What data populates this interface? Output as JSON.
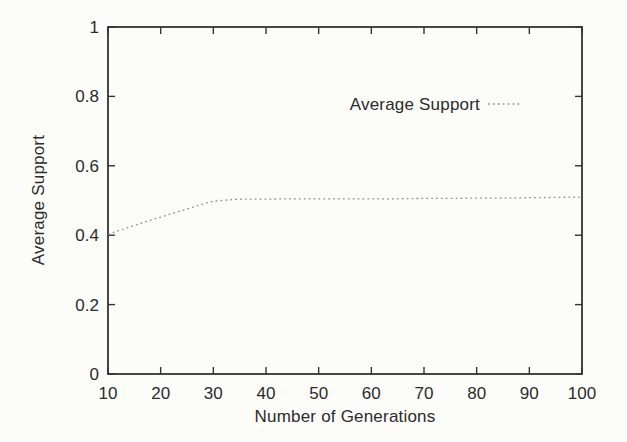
{
  "figure": {
    "background": "#fcfcf9"
  },
  "colors": {
    "axis": "#333333",
    "text": "#2b2b2b",
    "curve": "#8f8f8f"
  },
  "chart_data": {
    "type": "line",
    "title": "",
    "xlabel": "Number of Generations",
    "ylabel": "Average Support",
    "xlim": [
      10,
      100
    ],
    "ylim": [
      0,
      1
    ],
    "grid": false,
    "xticks": [
      10,
      20,
      30,
      40,
      50,
      60,
      70,
      80,
      90,
      100
    ],
    "xtick_labels": [
      "10",
      "20",
      "30",
      "40",
      "50",
      "60",
      "70",
      "80",
      "90",
      "100"
    ],
    "yticks": [
      0,
      0.2,
      0.4,
      0.6,
      0.8,
      1
    ],
    "ytick_labels": [
      "0",
      "0.2",
      "0.4",
      "0.6",
      "0.8",
      "1"
    ],
    "legend": {
      "position": "inside-upper-right",
      "entries": [
        {
          "label": "Average Support",
          "line_style": "dotted",
          "color": "#8f8f8f"
        }
      ]
    },
    "series": [
      {
        "name": "Average Support",
        "style": "dotted",
        "color": "#8f8f8f",
        "points": [
          [
            10,
            0.403
          ],
          [
            12,
            0.413
          ],
          [
            14,
            0.423
          ],
          [
            16,
            0.433
          ],
          [
            18,
            0.443
          ],
          [
            20,
            0.452
          ],
          [
            22,
            0.462
          ],
          [
            24,
            0.471
          ],
          [
            26,
            0.48
          ],
          [
            28,
            0.49
          ],
          [
            30,
            0.498
          ],
          [
            32,
            0.501
          ],
          [
            34,
            0.503
          ],
          [
            36,
            0.504
          ],
          [
            38,
            0.504
          ],
          [
            40,
            0.504
          ],
          [
            45,
            0.505
          ],
          [
            50,
            0.505
          ],
          [
            55,
            0.505
          ],
          [
            60,
            0.505
          ],
          [
            65,
            0.505
          ],
          [
            70,
            0.506
          ],
          [
            75,
            0.506
          ],
          [
            80,
            0.507
          ],
          [
            85,
            0.507
          ],
          [
            90,
            0.508
          ],
          [
            95,
            0.509
          ],
          [
            100,
            0.51
          ]
        ]
      }
    ]
  }
}
